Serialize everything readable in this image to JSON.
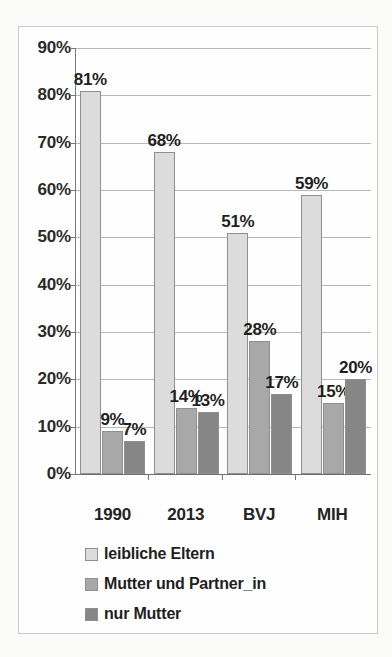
{
  "chart_data": {
    "type": "bar",
    "title": "",
    "subtitle": "",
    "xlabel": "",
    "ylabel": "",
    "categories": [
      "1990",
      "2013",
      "BVJ",
      "MIH"
    ],
    "series": [
      {
        "name": "leibliche Eltern",
        "values": [
          81,
          68,
          51,
          59
        ],
        "color": "#dcdcdc"
      },
      {
        "name": "Mutter und Partner_in",
        "values": [
          9,
          14,
          28,
          15
        ],
        "color": "#a8a8a8"
      },
      {
        "name": "nur Mutter",
        "values": [
          7,
          13,
          17,
          20
        ],
        "color": "#868686"
      }
    ],
    "value_labels": [
      [
        "81%",
        "68%",
        "51%",
        "59%"
      ],
      [
        "9%",
        "14%",
        "28%",
        "15%"
      ],
      [
        "7%",
        "13%",
        "17%",
        "20%"
      ]
    ],
    "ylim": [
      0,
      90
    ],
    "ytick_values": [
      90,
      80,
      70,
      60,
      50,
      40,
      30,
      20,
      10,
      0
    ],
    "yticks": [
      "90%",
      "80%",
      "70%",
      "60%",
      "50%",
      "40%",
      "30%",
      "20%",
      "10%",
      "0%"
    ],
    "grid": true,
    "legend_position": "bottom-left",
    "value_label_suffix": "%"
  },
  "legend": {
    "items": [
      {
        "label": "leibliche Eltern"
      },
      {
        "label": "Mutter und Partner_in"
      },
      {
        "label": "nur Mutter"
      }
    ]
  }
}
